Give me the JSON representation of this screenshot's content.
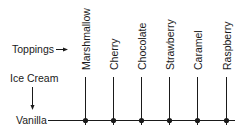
{
  "diagram": {
    "row_axis_label": "Toppings",
    "column_axis_label": "Ice Cream",
    "base": "Vanilla",
    "toppings": [
      {
        "label": "Marshmallow",
        "x": 85
      },
      {
        "label": "Cherry",
        "x": 113
      },
      {
        "label": "Chocolate",
        "x": 141
      },
      {
        "label": "Strawberry",
        "x": 169
      },
      {
        "label": "Caramel",
        "x": 197
      },
      {
        "label": "Raspberry",
        "x": 226
      }
    ],
    "colors": {
      "ink": "#1a1a1a",
      "background": "#ffffff"
    }
  }
}
